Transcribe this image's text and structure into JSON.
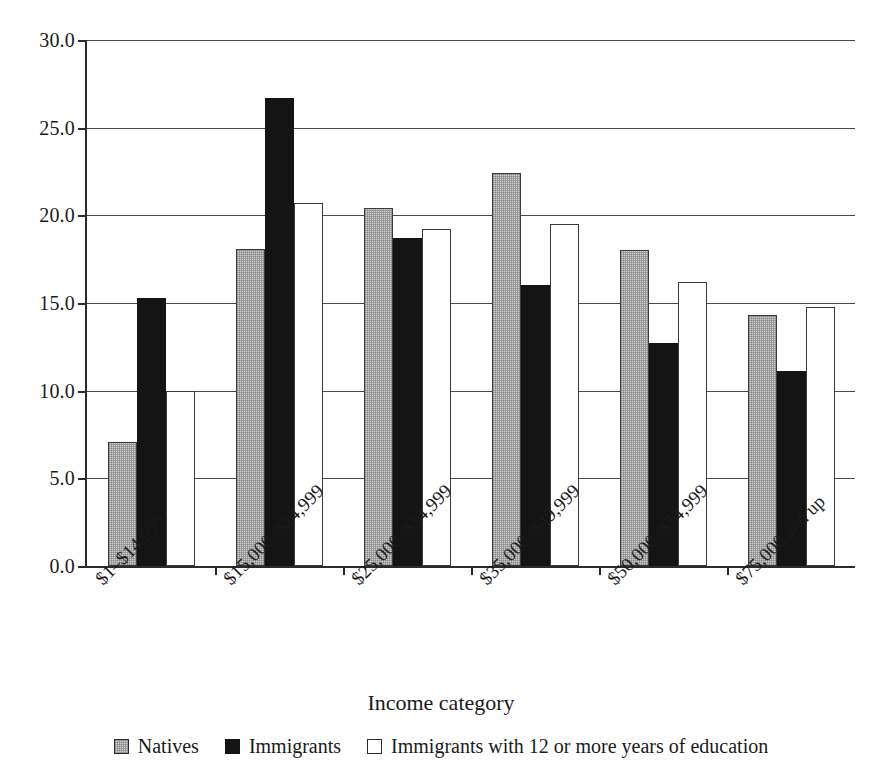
{
  "chart_data": {
    "type": "bar",
    "title": "",
    "xlabel": "Income category",
    "ylabel": "",
    "ylim": [
      0,
      30
    ],
    "ytick_step": 5,
    "ytick_labels": [
      "0.0",
      "5.0",
      "10.0",
      "15.0",
      "20.0",
      "25.0",
      "30.0"
    ],
    "ytick_values": [
      0,
      5,
      10,
      15,
      20,
      25,
      30
    ],
    "grid": "horizontal",
    "legend_position": "bottom",
    "categories": [
      "$1–$14,999",
      "$15,000–$24,999",
      "$25,000–$34,999",
      "$35,000–$49,999",
      "$50,000–$74,999",
      "$75,000 and up"
    ],
    "series": [
      {
        "name": "Natives",
        "color": "#d2d2d2",
        "style": "light-gray-hatched",
        "values": [
          7.1,
          18.1,
          20.4,
          22.4,
          18.0,
          14.3
        ]
      },
      {
        "name": "Immigrants",
        "color": "#141414",
        "style": "solid-black",
        "values": [
          15.3,
          26.7,
          18.7,
          16.0,
          12.7,
          11.1
        ]
      },
      {
        "name": "Immigrants with 12 or more years of education",
        "color": "#ffffff",
        "style": "white-outlined",
        "values": [
          10.0,
          20.7,
          19.2,
          19.5,
          16.2,
          14.8
        ]
      }
    ]
  },
  "legend": {
    "entries": [
      {
        "label": "Natives"
      },
      {
        "label": "Immigrants"
      },
      {
        "label": "Immigrants with 12 or more years of education"
      }
    ]
  }
}
